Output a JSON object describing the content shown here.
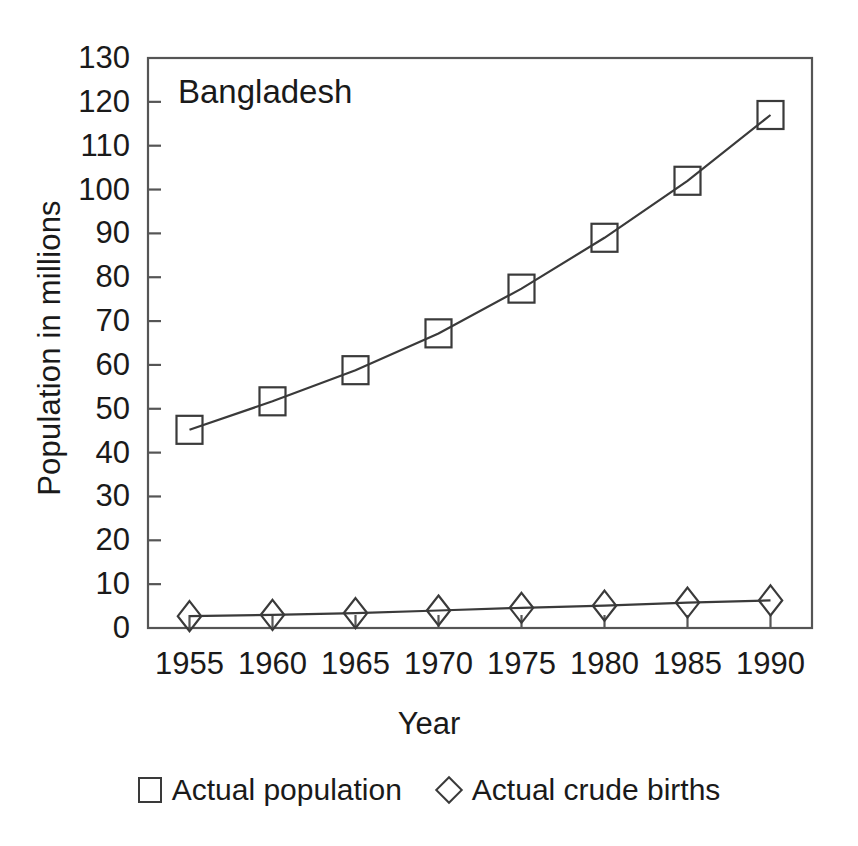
{
  "chart_data": {
    "type": "line",
    "title": "Bangladesh",
    "xlabel": "Year",
    "ylabel": "Population in millions",
    "x": [
      1955,
      1960,
      1965,
      1970,
      1975,
      1980,
      1985,
      1990
    ],
    "xtick_labels": [
      "1955",
      "1960",
      "1965",
      "1970",
      "1975",
      "1980",
      "1985",
      "1990"
    ],
    "ytick_labels": [
      "0",
      "10",
      "20",
      "30",
      "40",
      "50",
      "60",
      "70",
      "80",
      "90",
      "100",
      "110",
      "120",
      "130"
    ],
    "yticks": [
      0,
      10,
      20,
      30,
      40,
      50,
      60,
      70,
      80,
      90,
      100,
      110,
      120,
      130
    ],
    "ylim": [
      0,
      130
    ],
    "xlim": [
      1952.5,
      1992.5
    ],
    "grid": false,
    "legend_position": "below",
    "series": [
      {
        "name": "Actual population",
        "marker": "square",
        "values": [
          45.2,
          51.7,
          58.8,
          67.2,
          77.4,
          89.0,
          102.0,
          117.0
        ]
      },
      {
        "name": "Actual crude births",
        "marker": "diamond",
        "values": [
          2.7,
          3.0,
          3.4,
          4.0,
          4.6,
          5.1,
          5.8,
          6.3
        ]
      }
    ],
    "colors": {
      "line": "#3a3a3a",
      "marker_stroke": "#3a3a3a",
      "axis": "#555555",
      "text": "#1a1a1a",
      "background": "#ffffff"
    }
  },
  "legend": {
    "items": [
      {
        "label": "Actual population",
        "marker": "square-marker-icon"
      },
      {
        "label": "Actual crude births",
        "marker": "diamond-marker-icon"
      }
    ]
  }
}
